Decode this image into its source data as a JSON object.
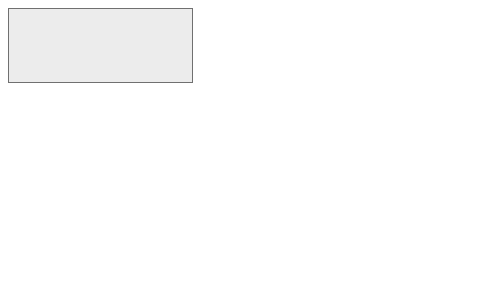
{
  "diagram": {
    "ecosystems": {
      "title": "Ecosystems and biodiversity",
      "fill": "#ececec"
    },
    "biophysical": {
      "title_lines": [
        "Biophysical",
        "structure",
        "or process"
      ],
      "desc_lines": [
        "(e.g. vegetation",
        "cover or net",
        "primary",
        "productivity)"
      ]
    },
    "function": {
      "title": "Function",
      "desc_lines": [
        "(e.g. slow",
        "water",
        "passage;",
        "biomass)"
      ]
    },
    "service": {
      "title": "Service",
      "desc_lines": [
        "(e.g. flood",
        "protection;",
        "products)"
      ]
    },
    "human_wellbeing": {
      "title": "Human well-being",
      "subtitle": "(socio-cultural context)",
      "fill": "#b4b4b4"
    },
    "benefits": {
      "title": "Benefit(s)",
      "desc_lines": [
        "(e.g. reduced",
        "risk / impacts,",
        "contribution",
        "to health,",
        "safety, avoided",
        "material",
        "damage;",
        "contribution to",
        "well-being,",
        "consumer value)"
      ]
    },
    "value": {
      "title_lines": [
        "(economic)",
        "Value"
      ],
      "desc_lines": [
        "(e.g. avoided",
        "damage;",
        "willingness to",
        "pay (WTP) for",
        "protection or",
        "for products)"
      ]
    },
    "arrows": [
      {
        "icon": "curved-arrow-icon",
        "from": "biophysical",
        "to": "function"
      },
      {
        "icon": "curved-arrow-icon",
        "from": "function",
        "to": "service"
      },
      {
        "icon": "curved-arrow-icon",
        "from": "service",
        "to": "benefits"
      },
      {
        "icon": "curved-arrow-icon",
        "from": "benefits",
        "to": "value"
      }
    ]
  }
}
